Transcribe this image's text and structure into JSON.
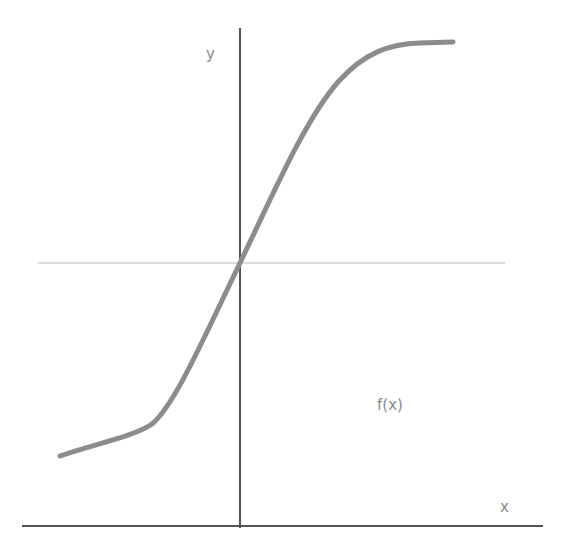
{
  "diagram": {
    "type": "sigmoid-function-sketch",
    "labels": {
      "y_axis": "y",
      "x_axis": "x",
      "function": "f(x)"
    },
    "colors": {
      "curve": "#8c8c8c",
      "axis": "#555555",
      "midline": "#cfcfcf",
      "label": "#8a8a8a"
    }
  }
}
